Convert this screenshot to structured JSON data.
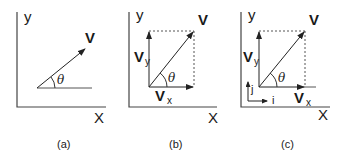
{
  "figure": {
    "panels": [
      {
        "id": "a",
        "caption": "(a)",
        "axis_y_label": "y",
        "axis_x_label": "X",
        "vector_label": "V",
        "angle_label": "θ"
      },
      {
        "id": "b",
        "caption": "(b)",
        "axis_y_label": "y",
        "axis_x_label": "X",
        "vector_label": "V",
        "angle_label": "θ",
        "component_y_label": "V",
        "component_y_sub": "y",
        "component_x_label": "V",
        "component_x_sub": "x"
      },
      {
        "id": "c",
        "caption": "(c)",
        "axis_y_label": "y",
        "axis_x_label": "X",
        "vector_label": "V",
        "angle_label": "θ",
        "component_y_label": "V",
        "component_y_sub": "y",
        "component_x_label": "V",
        "component_x_sub": "x",
        "unit_i_label": "i",
        "unit_j_label": "j"
      }
    ],
    "colors": {
      "line": "#333333",
      "dashed": "#555555",
      "background": "#ffffff"
    }
  }
}
